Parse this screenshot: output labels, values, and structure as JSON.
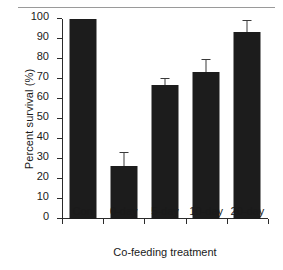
{
  "chart_data": {
    "type": "bar",
    "title": "",
    "xlabel": "Co-feeding treatment",
    "ylabel": "Percent survival (%)",
    "categories": [
      "Con",
      "0-day",
      "5-day",
      "10-day",
      "20-day"
    ],
    "values": [
      100,
      26.5,
      67,
      73.5,
      93.5
    ],
    "errors": [
      0,
      6.5,
      3,
      6,
      5.5
    ],
    "ylim": [
      0,
      100
    ],
    "ytick_labels": [
      "0",
      "10",
      "20",
      "30",
      "40",
      "50",
      "60",
      "70",
      "80",
      "90",
      "100"
    ],
    "ytick_values": [
      0,
      10,
      20,
      30,
      40,
      50,
      60,
      70,
      80,
      90,
      100
    ],
    "grid": false,
    "legend": null,
    "bar_color": "#1c1c1c",
    "error_bar_color": "#3a3a3a",
    "axis_color": "#2b2b2b",
    "background_color": "#ffffff",
    "top_rule_color": "#9a9a9a",
    "error_bar_style": "upper-only-with-cap"
  }
}
